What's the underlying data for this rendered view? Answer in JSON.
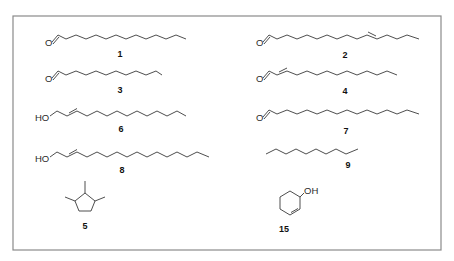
{
  "figure": {
    "type": "chemical-structures-panel",
    "frame_color": "#8a8a8a",
    "bond_color": "#3a3a3a"
  },
  "compounds": [
    {
      "id": "1",
      "label": "1",
      "class": "saturated aldehyde",
      "heteroatom": "O",
      "double_bond": false,
      "chain_bonds": 12
    },
    {
      "id": "2",
      "label": "2",
      "class": "unsaturated aldehyde (internal E double bond)",
      "heteroatom": "O",
      "double_bond": true,
      "chain_bonds": 14
    },
    {
      "id": "3",
      "label": "3",
      "class": "saturated aldehyde",
      "heteroatom": "O",
      "double_bond": false,
      "chain_bonds": 10
    },
    {
      "id": "4",
      "label": "4",
      "class": "alpha,beta-unsaturated aldehyde (E)",
      "heteroatom": "O",
      "double_bond": true,
      "chain_bonds": 12
    },
    {
      "id": "6",
      "label": "6",
      "class": "allylic alcohol (E)",
      "heteroatom": "HO",
      "double_bond": true,
      "chain_bonds": 12
    },
    {
      "id": "7",
      "label": "7",
      "class": "saturated aldehyde",
      "heteroatom": "O",
      "double_bond": false,
      "chain_bonds": 15
    },
    {
      "id": "8",
      "label": "8",
      "class": "allylic alcohol (E)",
      "heteroatom": "HO",
      "double_bond": true,
      "chain_bonds": 15
    },
    {
      "id": "9",
      "label": "9",
      "class": "alkane",
      "heteroatom": "",
      "double_bond": false,
      "chain_bonds": 8
    },
    {
      "id": "5",
      "label": "5",
      "class": "trimethylcyclopentane",
      "heteroatom": "",
      "double_bond": false
    },
    {
      "id": "15",
      "label": "15",
      "class": "cyclohexenol",
      "heteroatom": "OH",
      "double_bond": true
    }
  ],
  "atoms": {
    "o": "O",
    "ho": "HO",
    "oh": "OH"
  }
}
